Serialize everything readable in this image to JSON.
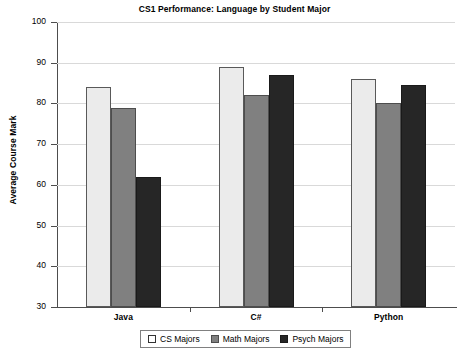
{
  "chart_data": {
    "type": "bar",
    "title": "CS1 Performance: Language by Student Major",
    "xlabel": "",
    "ylabel": "Average Course Mark",
    "categories": [
      "Java",
      "C#",
      "Python"
    ],
    "series": [
      {
        "name": "CS Majors",
        "color": "#ebebeb",
        "values": [
          84,
          89,
          86
        ]
      },
      {
        "name": "Math Majors",
        "color": "#808080",
        "values": [
          79,
          82,
          80
        ]
      },
      {
        "name": "Psych Majors",
        "color": "#262626",
        "values": [
          62,
          87,
          84.5
        ]
      }
    ],
    "ylim": [
      30,
      100
    ],
    "yticks": [
      30,
      40,
      50,
      60,
      70,
      80,
      90,
      100
    ],
    "ytick_labels": [
      "30",
      "40",
      "50",
      "60",
      "70",
      "80",
      "90",
      "100"
    ],
    "grid": true,
    "legend_position": "bottom"
  },
  "style": {
    "grid_color": "#d9d9d9",
    "axis_color": "#4d4d4d",
    "background": "#ffffff",
    "text_color": "#000000"
  }
}
